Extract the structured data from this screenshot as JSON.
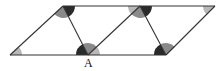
{
  "diagram": {
    "type": "parallelogram tessellation with marked angles",
    "labels": [
      {
        "text": "A",
        "x": 88,
        "y": 67
      }
    ],
    "colors": {
      "line": "#333333",
      "dark": "#2a2a2a",
      "medium": "#8a8a8a",
      "light": "#b8b8b8",
      "background": "#ffffff"
    },
    "vertices": {
      "bottom": [
        [
          10,
          55
        ],
        [
          88,
          55
        ],
        [
          166,
          55
        ]
      ],
      "top": [
        [
          63,
          6
        ],
        [
          140,
          6
        ],
        [
          215,
          6
        ]
      ]
    }
  }
}
